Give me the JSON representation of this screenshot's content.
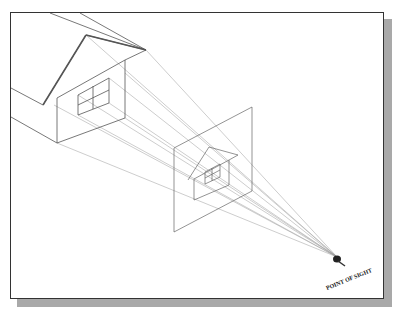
{
  "figure": {
    "labels": {
      "point_of_sight": "POINT OF SIGHT"
    },
    "elements": [
      "house-object",
      "picture-plane",
      "projected-house",
      "projection-rays",
      "point-of-sight-eye"
    ],
    "colors": {
      "frame_border": "#333333",
      "shadow": "#a9a9a9",
      "lines": "#555555",
      "rays": "#9a9a9a"
    }
  }
}
